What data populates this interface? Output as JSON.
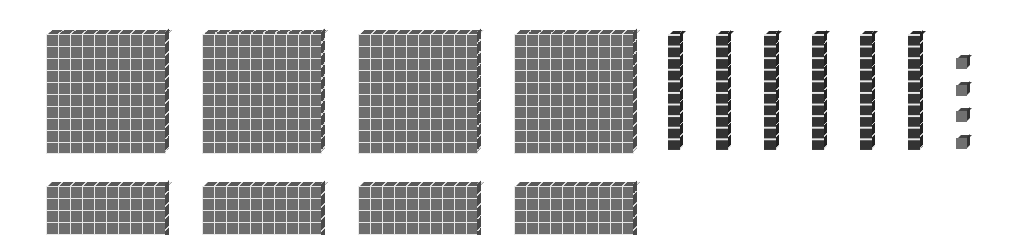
{
  "diagram": {
    "type": "base-ten-blocks",
    "colors": {
      "flat": "#6e6e6e",
      "rod": "#333333",
      "unit": "#707070",
      "grid_line": "#e8e8e8",
      "background": "#ffffff"
    },
    "hundreds_flats": {
      "count": 8,
      "grid": "10x10",
      "positions": [
        {
          "x": 46,
          "y": 34
        },
        {
          "x": 202,
          "y": 34
        },
        {
          "x": 358,
          "y": 34
        },
        {
          "x": 514,
          "y": 34
        },
        {
          "x": 46,
          "y": 186
        },
        {
          "x": 202,
          "y": 186
        },
        {
          "x": 358,
          "y": 186
        },
        {
          "x": 514,
          "y": 186
        }
      ]
    },
    "tens_rods": {
      "count": 6,
      "cubes_per_rod": 10,
      "positions": [
        {
          "x": 668,
          "y": 34
        },
        {
          "x": 716,
          "y": 34
        },
        {
          "x": 764,
          "y": 34
        },
        {
          "x": 812,
          "y": 34
        },
        {
          "x": 860,
          "y": 34
        },
        {
          "x": 908,
          "y": 34
        }
      ]
    },
    "ones_units": {
      "count": 4,
      "positions": [
        {
          "x": 956,
          "y": 58
        },
        {
          "x": 956,
          "y": 85
        },
        {
          "x": 956,
          "y": 111
        },
        {
          "x": 956,
          "y": 138
        }
      ]
    }
  }
}
